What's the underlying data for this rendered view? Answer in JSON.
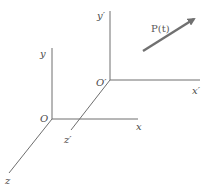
{
  "diagram": {
    "title": "",
    "frames": [
      {
        "name": "unprimed",
        "origin_label": "O",
        "axis_labels": {
          "x": "x",
          "y": "y",
          "z": "z"
        }
      },
      {
        "name": "primed",
        "origin_label": "O′",
        "axis_labels": {
          "x": "x′",
          "y": "y′",
          "z": "z′"
        }
      }
    ],
    "vector": {
      "label": "P(t)",
      "color": "#707070"
    },
    "colors": {
      "axis": "#6e6e6e",
      "text": "#4a4a4a",
      "background": "#ffffff"
    }
  }
}
